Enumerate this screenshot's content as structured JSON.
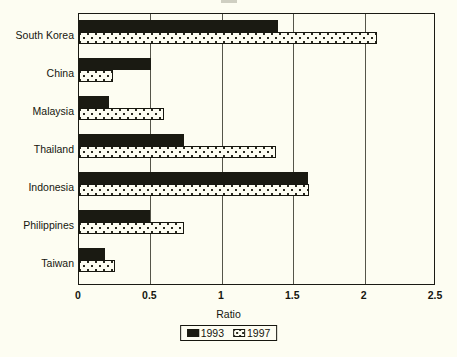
{
  "chart_data": {
    "type": "bar",
    "orientation": "horizontal",
    "title": "",
    "xlabel": "Ratio",
    "ylabel": "",
    "xlim": [
      0,
      2.5
    ],
    "xticks": [
      "0",
      "0.5",
      "1",
      "1.5",
      "2",
      "2.5"
    ],
    "xtick_values": [
      0,
      0.5,
      1,
      1.5,
      2,
      2.5
    ],
    "grid": true,
    "grid_axis": "x",
    "legend_position": "bottom",
    "categories": [
      "South Korea",
      "China",
      "Malaysia",
      "Thailand",
      "Indonesia",
      "Philippines",
      "Taiwan"
    ],
    "series": [
      {
        "name": "1993",
        "values": [
          1.4,
          0.51,
          0.21,
          0.74,
          1.61,
          0.5,
          0.18
        ]
      },
      {
        "name": "1997",
        "values": [
          2.1,
          0.24,
          0.6,
          1.39,
          1.62,
          0.74,
          0.25
        ]
      }
    ]
  },
  "legend": {
    "items": [
      {
        "label": "1993",
        "swatch": "solid-black-swatch"
      },
      {
        "label": "1997",
        "swatch": "dotted-white-swatch"
      }
    ]
  },
  "colors": {
    "series_1993": "#1a1a12",
    "series_1997": "#fdfdf2",
    "background": "#fdfdf2",
    "axis": "#16160f",
    "gridline": "#55554a"
  }
}
